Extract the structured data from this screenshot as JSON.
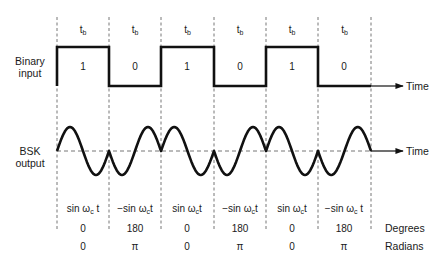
{
  "diagram": {
    "type": "binary-shift-keying-waveform",
    "period_label": "t",
    "period_label_sub": "b",
    "binary_input": {
      "label_line1": "Binary",
      "label_line2": "input",
      "bits": [
        "1",
        "0",
        "1",
        "0",
        "1",
        "0"
      ]
    },
    "bsk_output": {
      "label_line1": "BSK",
      "label_line2": "output"
    },
    "time_axis_label": "Time",
    "phase_table": {
      "functions": [
        {
          "prefix": "sin ω",
          "sub": "c",
          "suffix": " t"
        },
        {
          "prefix": "−sin ω",
          "sub": "c",
          "suffix": "t"
        },
        {
          "prefix": "sin ω",
          "sub": "c",
          "suffix": "t"
        },
        {
          "prefix": "−sin ω",
          "sub": "c",
          "suffix": "t"
        },
        {
          "prefix": "sin ω",
          "sub": "c",
          "suffix": "t"
        },
        {
          "prefix": "−sin ω",
          "sub": "c",
          "suffix": " t"
        }
      ],
      "degrees": [
        "0",
        "180",
        "0",
        "180",
        "0",
        "180"
      ],
      "radians": [
        "0",
        "π",
        "0",
        "π",
        "0",
        "π"
      ],
      "degrees_label": "Degrees",
      "radians_label": "Radians"
    },
    "colors": {
      "line": "#111111",
      "dashed": "#777777",
      "text": "#1a1a1a"
    }
  }
}
